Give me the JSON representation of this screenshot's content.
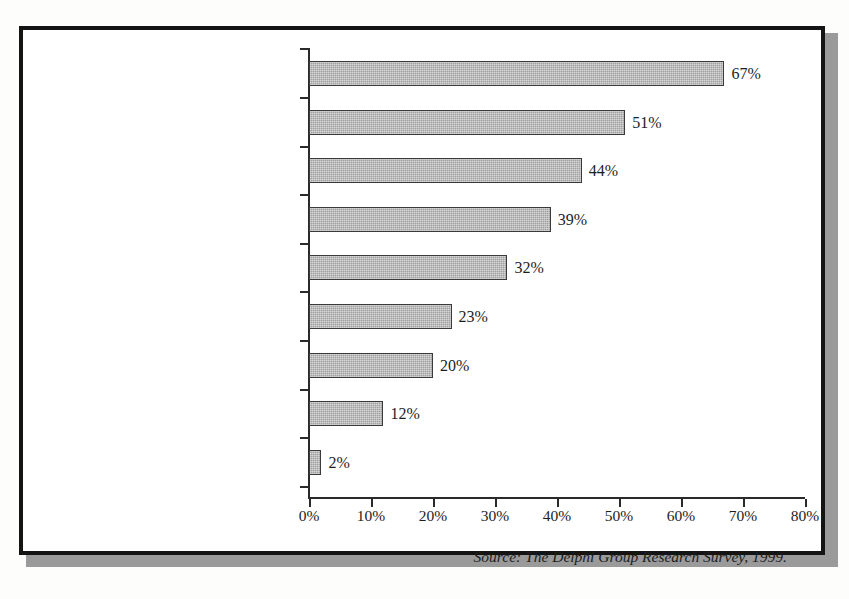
{
  "figure": {
    "source_note": "Source: The Delphi Group Research Survey, 1999.",
    "frame_color": "#141414",
    "shadow_color": "#9a9a9a",
    "bar_fill_color": "#a0a0a0",
    "bar_border_color": "#3a3a3a",
    "text_color": "#1d1d1d"
  },
  "chart_data": {
    "type": "bar",
    "orientation": "horizontal",
    "title": "",
    "subtitle": "",
    "xlabel": "",
    "ylabel": "",
    "xlim": [
      0,
      80
    ],
    "grid": false,
    "legend": null,
    "categories": [
      "Databases and knowledgebases",
      "Document management",
      "Intranets",
      "Groupware and collaborative s/w",
      "Search and navigation tools",
      "Decision support and AI",
      "Workflow",
      "Internet and Web",
      "Multimedia"
    ],
    "values": [
      67,
      51,
      44,
      39,
      32,
      23,
      20,
      12,
      2
    ],
    "value_labels": [
      "67%",
      "51%",
      "44%",
      "39%",
      "32%",
      "23%",
      "20%",
      "12%",
      "2%"
    ],
    "x_ticks": [
      0,
      10,
      20,
      30,
      40,
      50,
      60,
      70,
      80
    ],
    "x_tick_labels": [
      "0%",
      "10%",
      "20%",
      "30%",
      "40%",
      "50%",
      "60%",
      "70%",
      "80%"
    ],
    "annotations": [
      "Source: The Delphi Group Research Survey, 1999."
    ]
  }
}
